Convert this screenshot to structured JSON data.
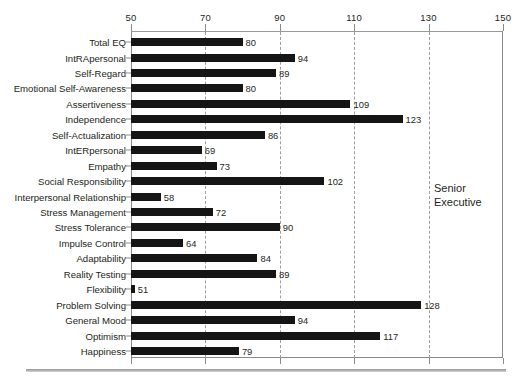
{
  "annotation": {
    "text": "Senior\nExecutive"
  },
  "chart_data": {
    "type": "bar",
    "orientation": "horizontal",
    "title": "",
    "xlabel": "",
    "ylabel": "",
    "xlim": [
      50,
      150
    ],
    "xticks": [
      50,
      70,
      90,
      110,
      130,
      150
    ],
    "xtick_labels": [
      "50",
      "70",
      "90",
      "110",
      "130",
      "150"
    ],
    "gridlines": [
      70,
      90,
      110,
      130
    ],
    "grid": true,
    "grid_style": "dashed",
    "legend": "none",
    "bar_color": "#151515",
    "axis_color": "#8a8a8a",
    "annotations": [
      "Senior Executive"
    ],
    "categories": [
      "Total EQ",
      "IntRApersonal",
      "Self-Regard",
      "Emotional Self-Awareness",
      "Assertiveness",
      "Independence",
      "Self-Actualization",
      "IntERpersonal",
      "Empathy",
      "Social Responsibility",
      "Interpersonal Relationship",
      "Stress Management",
      "Stress Tolerance",
      "Impulse Control",
      "Adaptability",
      "Reality Testing",
      "Flexibility",
      "Problem Solving",
      "General Mood",
      "Optimism",
      "Happiness"
    ],
    "values": [
      80,
      94,
      89,
      80,
      109,
      123,
      86,
      69,
      73,
      102,
      58,
      72,
      90,
      64,
      84,
      89,
      51,
      128,
      94,
      117,
      79
    ],
    "value_labels": [
      "80",
      "94",
      "89",
      "80",
      "109",
      "123",
      "86",
      "69",
      "73",
      "102",
      "58",
      "72",
      "90",
      "64",
      "84",
      "89",
      "51",
      "128",
      "94",
      "117",
      "79"
    ]
  }
}
